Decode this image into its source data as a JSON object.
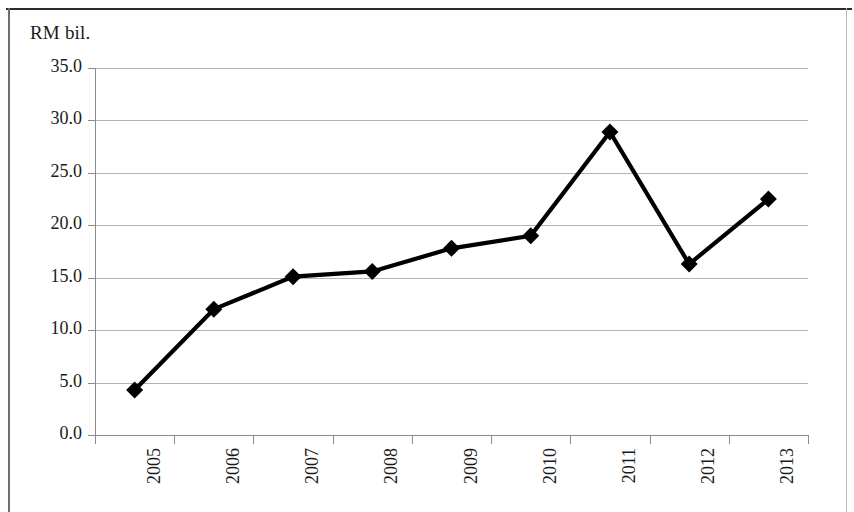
{
  "chart_data": {
    "type": "line",
    "title": "RM bil.",
    "xlabel": "",
    "ylabel": "RM bil.",
    "categories": [
      "2005",
      "2006",
      "2007",
      "2008",
      "2009",
      "2010",
      "2011",
      "2012",
      "2013"
    ],
    "values": [
      4.3,
      12.0,
      15.1,
      15.6,
      17.8,
      19.0,
      28.9,
      16.3,
      22.5
    ],
    "series": [
      {
        "name": "RM bil.",
        "values": [
          4.3,
          12.0,
          15.1,
          15.6,
          17.8,
          19.0,
          28.9,
          16.3,
          22.5
        ]
      }
    ],
    "ylim": [
      0,
      35
    ],
    "ytick_labels": [
      "35.0",
      "30.0",
      "25.0",
      "20.0",
      "15.0",
      "10.0",
      "5.0",
      "0.0"
    ],
    "ytick_values": [
      35,
      30,
      25,
      20,
      15,
      10,
      5,
      0
    ],
    "grid": true,
    "legend": false,
    "marker": "diamond",
    "line_color": "#000000",
    "marker_color": "#000000",
    "grid_color": "#9a9a9a",
    "axis_color": "#8c8c8c",
    "text_color": "#1a1a1a",
    "xtick_rotation": -90
  }
}
